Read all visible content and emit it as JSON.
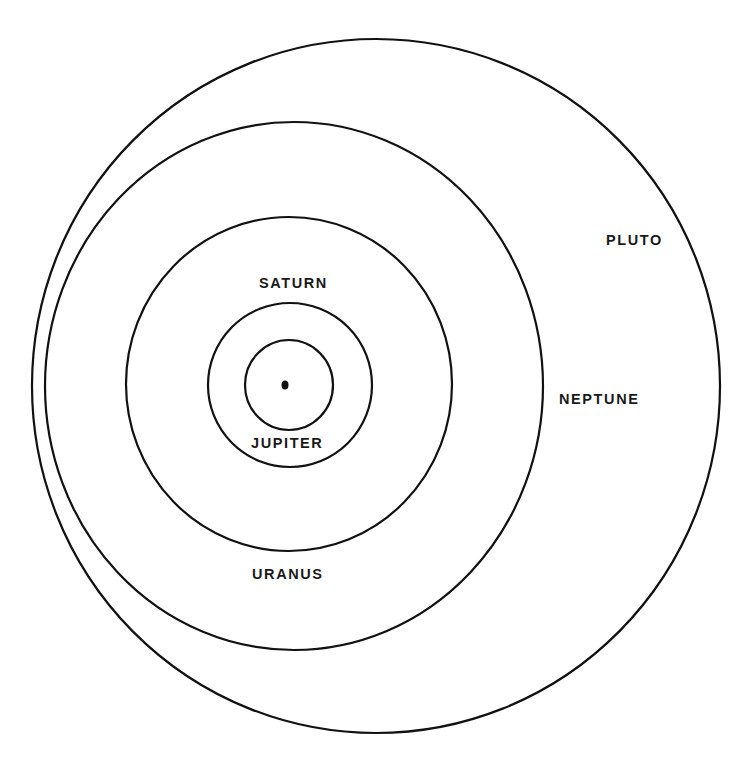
{
  "diagram": {
    "colors": {
      "line": "#111111",
      "text": "#1a1a1a",
      "background": "#ffffff"
    },
    "sun": {
      "cx": 285,
      "cy": 385,
      "rx": 3.5,
      "ry": 4.5
    },
    "orbits": [
      {
        "name": "Jupiter",
        "cx": 289,
        "cy": 385,
        "rx": 44,
        "ry": 45
      },
      {
        "name": "Saturn",
        "cx": 290,
        "cy": 385,
        "rx": 82,
        "ry": 82
      },
      {
        "name": "Uranus",
        "cx": 289,
        "cy": 384,
        "rx": 163,
        "ry": 167
      },
      {
        "name": "Neptune",
        "cx": 294,
        "cy": 386,
        "rx": 249,
        "ry": 264
      },
      {
        "name": "Pluto",
        "cx": 376,
        "cy": 386,
        "rx": 344,
        "ry": 347
      }
    ],
    "labels": {
      "jupiter": "JUPITER",
      "saturn": "SATURN",
      "uranus": "URANUS",
      "neptune": "NEPTUNE",
      "pluto": "PLUTO"
    }
  }
}
